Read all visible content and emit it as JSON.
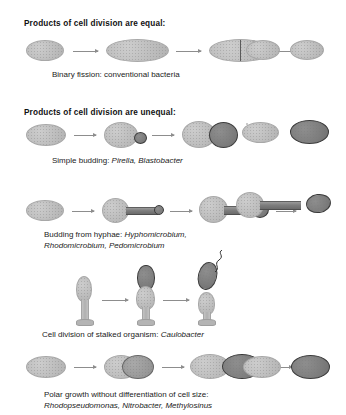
{
  "figure": {
    "sections": [
      {
        "id": "equal",
        "heading": "Products of cell division are equal:",
        "caption_lines": [
          "Binary fission: conventional bacteria"
        ],
        "caption_italic": [
          ""
        ],
        "stages": 4,
        "arrows": 3
      },
      {
        "id": "unequal",
        "heading": "Products of cell division are unequal:",
        "caption_lines": [
          "Simple budding: "
        ],
        "caption_italic": [
          "Pirella, Blastobacter"
        ],
        "stages": 4,
        "arrows": 3
      },
      {
        "id": "hyphae",
        "heading": "",
        "caption_lines": [
          "Budding from hyphae: "
        ],
        "caption_italic": [
          "Hyphomicrobium,",
          "Rhodomicrobium, Pedomicrobium"
        ],
        "stages": 4,
        "arrows": 3
      },
      {
        "id": "stalked",
        "heading": "",
        "caption_lines": [
          "Cell division of stalked organism: "
        ],
        "caption_italic": [
          "Caulobacter"
        ],
        "stages": 3,
        "arrows": 2
      },
      {
        "id": "polar",
        "heading": "",
        "caption_lines": [
          "Polar growth without differentiation of cell size:"
        ],
        "caption_italic": [
          "Rhodopseudomonas, Nitrobacter, Methylosinus"
        ],
        "stages": 4,
        "arrows": 3
      }
    ],
    "colors": {
      "light_cell": "#bdbdbd",
      "dark_cell": "#7d7d7d",
      "outline": "#3a3a3a",
      "arrow": "#8d8d8d",
      "text": "#1a1a1a",
      "background": "#ffffff"
    },
    "labels": {
      "heading_equal": "Products of cell division are equal:",
      "heading_unequal": "Products of cell division are unequal:",
      "cap_binary_fission": "Binary fission: conventional bacteria",
      "cap_budding_prefix": "Simple budding: ",
      "cap_budding_species": "Pirella, Blastobacter",
      "cap_hyphae_prefix": "Budding from hyphae: ",
      "cap_hyphae_species1": "Hyphomicrobium,",
      "cap_hyphae_species2": "Rhodomicrobium, Pedomicrobium",
      "cap_stalked_prefix": "Cell division of stalked organism: ",
      "cap_stalked_species": "Caulobacter",
      "cap_polar_line1": "Polar growth without differentiation of cell size:",
      "cap_polar_species": "Rhodopseudomonas, Nitrobacter, Methylosinus"
    }
  }
}
